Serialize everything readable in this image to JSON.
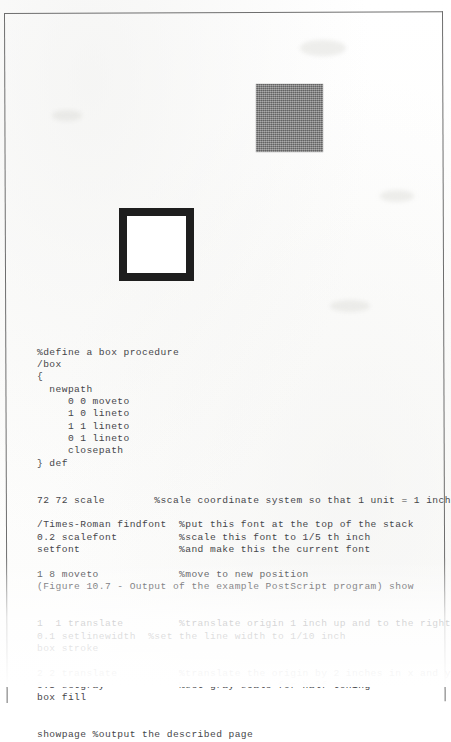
{
  "page": {
    "title": "Figure 10.7 - Output of the example PostScript program",
    "paper_color": "#fefefe",
    "border_color": "#6e6e6e",
    "ink_color": "#46464a"
  },
  "figures": {
    "gray_square": {
      "name": "gray-filled-box",
      "fill_label": "0.5 setgray",
      "color": "#7c7c7c"
    },
    "stroked_box": {
      "name": "stroked-outline-box",
      "stroke_label": "0.1 setlinewidth",
      "color": "#1e1e1e"
    }
  },
  "code": {
    "language": "PostScript",
    "lines": [
      "%define a box procedure",
      "/box",
      "{",
      "  newpath",
      "     0 0 moveto",
      "     1 0 lineto",
      "     1 1 lineto",
      "     0 1 lineto",
      "     closepath",
      "} def",
      "",
      "",
      "72 72 scale        %scale coordinate system so that 1 unit = 1 inch",
      "",
      "/Times-Roman findfont  %put this font at the top of the stack",
      "0.2 scalefont          %scale this font to 1/5 th inch",
      "setfont                %and make this the current font",
      "",
      "1 8 moveto             %move to new position",
      "(Figure 10.7 - Output of the example PostScript program) show",
      "",
      "",
      "1  1 translate         %translate origin 1 inch up and to the right",
      "0.1 setlinewidth  %set the line width to 1/10 inch",
      "box stroke",
      "",
      "2 2 translate          %translate the origin by 2 inches in x and y",
      "0.5 setgray            %set gray scale for half toning",
      "box fill",
      "",
      "",
      "showpage %output the described page"
    ]
  }
}
